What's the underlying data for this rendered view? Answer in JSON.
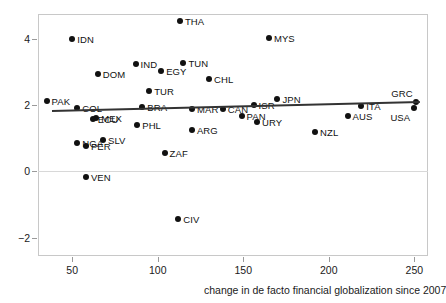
{
  "chart_data": {
    "type": "scatter",
    "title": "",
    "subtitle": "",
    "xlabel": "change in de facto financial globalization since 2007",
    "ylabel": "",
    "xlim": [
      30,
      258
    ],
    "ylim": [
      -2.55,
      4.75
    ],
    "xticks": [
      50,
      100,
      150,
      200,
      250
    ],
    "yticks": [
      -2,
      0,
      2,
      4
    ],
    "grid": "zero-line-only",
    "legend": "none",
    "point_color": "#111111",
    "fitline_color": "#333333",
    "frame_color": "#c8c8c8",
    "fitline": {
      "x_start": 38,
      "y_start": 1.86,
      "x_end": 253,
      "y_end": 2.13
    },
    "points": [
      {
        "label": "THA",
        "x": 113,
        "y": 4.55,
        "label_pos": "right"
      },
      {
        "label": "MYS",
        "x": 165,
        "y": 4.03,
        "label_pos": "right"
      },
      {
        "label": "IDN",
        "x": 50,
        "y": 4.01,
        "label_pos": "right"
      },
      {
        "label": "TUN",
        "x": 115,
        "y": 3.27,
        "label_pos": "right"
      },
      {
        "label": "IND",
        "x": 87,
        "y": 3.24,
        "label_pos": "right"
      },
      {
        "label": "EGY",
        "x": 102,
        "y": 3.04,
        "label_pos": "right"
      },
      {
        "label": "DOM",
        "x": 65,
        "y": 2.95,
        "label_pos": "right"
      },
      {
        "label": "CHL",
        "x": 130,
        "y": 2.78,
        "label_pos": "right"
      },
      {
        "label": "TUR",
        "x": 95,
        "y": 2.42,
        "label_pos": "right"
      },
      {
        "label": "PAK",
        "x": 35,
        "y": 2.14,
        "label_pos": "right"
      },
      {
        "label": "JPN",
        "x": 170,
        "y": 2.18,
        "label_pos": "right"
      },
      {
        "label": "ISR",
        "x": 156,
        "y": 2.02,
        "label_pos": "right"
      },
      {
        "label": "GRC",
        "x": 251,
        "y": 2.1,
        "label_pos": "above"
      },
      {
        "label": "BRA",
        "x": 91,
        "y": 1.95,
        "label_pos": "right"
      },
      {
        "label": "COL",
        "x": 53,
        "y": 1.9,
        "label_pos": "right"
      },
      {
        "label": "MAR",
        "x": 120,
        "y": 1.89,
        "label_pos": "right"
      },
      {
        "label": "ITA",
        "x": 219,
        "y": 1.97,
        "label_pos": "right"
      },
      {
        "label": "CAN",
        "x": 138,
        "y": 1.88,
        "label_pos": "right"
      },
      {
        "label": "USA",
        "x": 250,
        "y": 1.91,
        "label_pos": "below"
      },
      {
        "label": "PAN",
        "x": 149,
        "y": 1.68,
        "label_pos": "right"
      },
      {
        "label": "AUS",
        "x": 211,
        "y": 1.66,
        "label_pos": "right"
      },
      {
        "label": "MEX",
        "x": 64,
        "y": 1.61,
        "label_pos": "right"
      },
      {
        "label": "ECU",
        "x": 62,
        "y": 1.57,
        "label_pos": "right"
      },
      {
        "label": "URY",
        "x": 158,
        "y": 1.5,
        "label_pos": "right"
      },
      {
        "label": "PHL",
        "x": 88,
        "y": 1.39,
        "label_pos": "right"
      },
      {
        "label": "ARG",
        "x": 120,
        "y": 1.24,
        "label_pos": "right"
      },
      {
        "label": "NZL",
        "x": 192,
        "y": 1.2,
        "label_pos": "right"
      },
      {
        "label": "SLV",
        "x": 68,
        "y": 0.94,
        "label_pos": "right"
      },
      {
        "label": "NGA",
        "x": 53,
        "y": 0.86,
        "label_pos": "right"
      },
      {
        "label": "PER",
        "x": 58,
        "y": 0.77,
        "label_pos": "right"
      },
      {
        "label": "ZAF",
        "x": 104,
        "y": 0.57,
        "label_pos": "right"
      },
      {
        "label": "VEN",
        "x": 58,
        "y": -0.17,
        "label_pos": "right"
      },
      {
        "label": "CIV",
        "x": 112,
        "y": -1.43,
        "label_pos": "right"
      }
    ]
  }
}
